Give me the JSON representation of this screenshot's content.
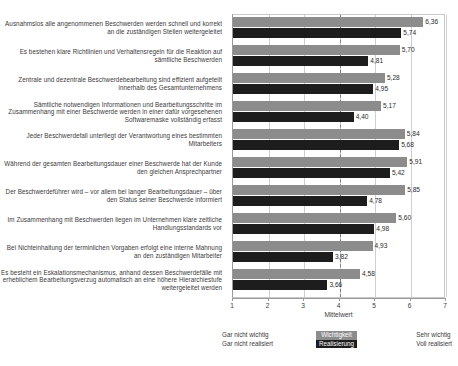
{
  "chart_data": {
    "type": "bar",
    "orientation": "horizontal",
    "title": "",
    "xlabel": "Mittelwert",
    "ylabel": "",
    "xlim": [
      1,
      7
    ],
    "xticks": [
      1,
      2,
      3,
      4,
      5,
      6,
      7
    ],
    "grid": true,
    "reference_line": 4,
    "legend_position": "bottom-center",
    "colors": {
      "importance": "#8c8c8c",
      "realisation": "#1d1d1d",
      "gridline": "#cfcfcf",
      "axis": "#9a9a9a",
      "text": "#3a3a3a"
    },
    "categories": [
      "Ausnahmslos alle angenommenen Beschwerden werden schnell und korrekt an die zuständigen Stellen weitergeleitet",
      "Es bestehen klare Richtlinien und Verhaltensregeln für die Reaktion auf sämtliche Beschwerden",
      "Zentrale und dezentrale Beschwerdebearbeitung sind effizient aufgeteilt innerhalb des Gesamtunternehmens",
      "Sämtliche notwendigen Informationen und Bearbeitungsschritte im Zusammenhang mit einer Beschwerde werden in einer dafür vorgesehenen Softwaremaske vollständig erfasst",
      "Jeder Beschwerdefall unterliegt der Verantwortung eines bestimmten Mitarbeiters",
      "Während der gesamten Bearbeitungsdauer einer Beschwerde hat der Kunde den gleichen Ansprechpartner",
      "Der Beschwerdeführer wird – vor allem bei langer Bearbeitungsdauer – über den Status seiner Beschwerde informiert",
      "Im Zusammenhang mit Beschwerden liegen im Unternehmen klare zeitliche Handlungsstandards vor",
      "Bei Nichteinhaltung der terminlichen Vorgaben erfolgt eine interne Mahnung an den zuständigen Mitarbeiter",
      "Es besteht ein Eskalationsmechanismus, anhand dessen Beschwerdefälle mit erheblichem Bearbeitungsverzug automatisch an eine höhere Hierarchiestufe weitergeleitet werden"
    ],
    "series": [
      {
        "name": "Wichtigkeit",
        "values": [
          6.36,
          5.7,
          5.28,
          5.17,
          5.84,
          5.91,
          5.85,
          5.6,
          4.93,
          4.58
        ],
        "labels": [
          "6,36",
          "5,70",
          "5,28",
          "5,17",
          "5,84",
          "5,91",
          "5,85",
          "5,60",
          "4,93",
          "4,58"
        ]
      },
      {
        "name": "Realisierung",
        "values": [
          5.74,
          4.81,
          4.95,
          4.4,
          5.68,
          5.42,
          4.78,
          4.98,
          3.82,
          3.66
        ],
        "labels": [
          "5,74",
          "4,81",
          "4,95",
          "4,40",
          "5,68",
          "5,42",
          "4,78",
          "4,98",
          "3,82",
          "3,66"
        ]
      }
    ]
  },
  "axis": {
    "title": "Mittelwert",
    "tick_labels": [
      "1",
      "2",
      "3",
      "4",
      "5",
      "6",
      "7"
    ]
  },
  "legend": {
    "left_line1": "Gar nicht wichtig",
    "left_line2": "Gar nicht realisiert",
    "key_importance": "Wichtigkeit",
    "key_realisation": "Realisierung",
    "right_line1": "Sehr wichtig",
    "right_line2": "Voll realisiert"
  }
}
